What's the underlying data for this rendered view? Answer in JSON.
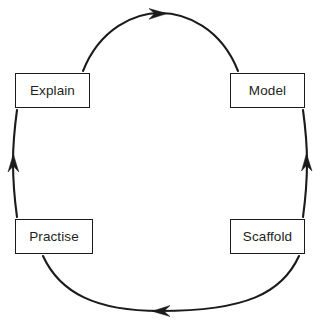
{
  "diagram": {
    "type": "cycle",
    "direction": "clockwise",
    "canvas": {
      "width": 321,
      "height": 325,
      "background": "#ffffff"
    },
    "stroke_color": "#1b1b1b",
    "text_color": "#231f20",
    "nodes": [
      {
        "id": "explain",
        "label": "Explain",
        "position": "top-left"
      },
      {
        "id": "model",
        "label": "Model",
        "position": "top-right"
      },
      {
        "id": "scaffold",
        "label": "Scaffold",
        "position": "bottom-right"
      },
      {
        "id": "practise",
        "label": "Practise",
        "position": "bottom-left"
      }
    ],
    "arcs": [
      {
        "id": "arc-explain-to-model",
        "from": "explain",
        "to": "model",
        "arrow_direction": "right"
      },
      {
        "id": "arc-model-to-scaffold",
        "from": "model",
        "to": "scaffold",
        "arrow_direction": "down"
      },
      {
        "id": "arc-scaffold-to-practise",
        "from": "scaffold",
        "to": "practise",
        "arrow_direction": "left"
      },
      {
        "id": "arc-practise-to-explain",
        "from": "practise",
        "to": "explain",
        "arrow_direction": "up"
      }
    ]
  }
}
